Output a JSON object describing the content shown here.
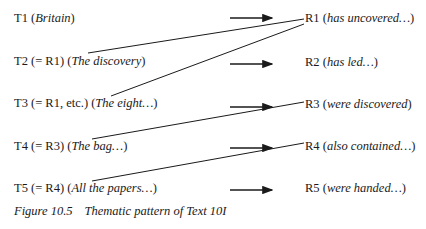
{
  "themes": [
    {
      "id": "T1",
      "ref": "",
      "gloss": "Britain"
    },
    {
      "id": "T2",
      "ref": "(= R1)",
      "gloss": "The discovery"
    },
    {
      "id": "T3",
      "ref": "(= R1, etc.)",
      "gloss": "The eight…"
    },
    {
      "id": "T4",
      "ref": "(= R3)",
      "gloss": "The bag…"
    },
    {
      "id": "T5",
      "ref": "(= R4)",
      "gloss": "All the papers…"
    }
  ],
  "rhemes": [
    {
      "id": "R1",
      "gloss": "has uncovered…"
    },
    {
      "id": "R2",
      "gloss": "has led…"
    },
    {
      "id": "R3",
      "gloss": "were discovered"
    },
    {
      "id": "R4",
      "gloss": "also contained…"
    },
    {
      "id": "R5",
      "gloss": "were handed…"
    }
  ],
  "links": [
    {
      "from": "R1",
      "to": "T2"
    },
    {
      "from": "R1",
      "to": "T3"
    },
    {
      "from": "R3",
      "to": "T4"
    },
    {
      "from": "R4",
      "to": "T5"
    }
  ],
  "caption": {
    "number": "Figure 10.5",
    "title": "Thematic pattern of Text 10I"
  }
}
